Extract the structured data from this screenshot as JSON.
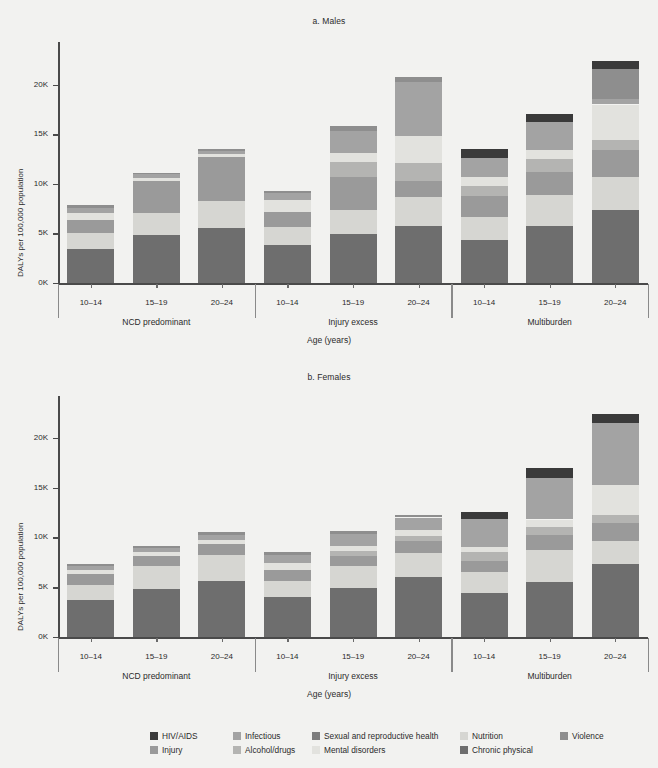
{
  "header": {
    "cropped_line": "Figure  ·  DALYs per 100 000 population by age group, sex and country group"
  },
  "panels": [
    {
      "title": "a. Males",
      "sex": "Males"
    },
    {
      "title": "b. Females",
      "sex": "Females"
    }
  ],
  "axis": {
    "ylabel": "DALYs per 100,000 population",
    "xlabel": "Age (years)",
    "yticks": [
      "0K",
      "5K",
      "10K",
      "15K",
      "20K"
    ],
    "ytick_values": [
      0,
      5000,
      10000,
      15000,
      20000
    ],
    "ymax": 24000
  },
  "groups": [
    "NCD predominant",
    "Injury excess",
    "Multiburden"
  ],
  "ages": [
    "10–14",
    "15–19",
    "20–24"
  ],
  "colors": {
    "HIV/AIDS": "#3a3a3a",
    "Infectious": "#a3a3a3",
    "Sexual and reproductive health": "#7d7d7d",
    "Nutrition": "#d6d6d2",
    "Violence": "#8e8e8e",
    "Injury": "#9a9a9a",
    "Alcohol/drugs": "#b4b4b2",
    "Mental disorders": "#e2e2de",
    "Chronic physical": "#6e6e6e"
  },
  "legend": [
    [
      {
        "label": "HIV/AIDS",
        "color": "#3a3a3a"
      },
      {
        "label": "Infectious",
        "color": "#a3a3a3"
      },
      {
        "label": "Sexual and reproductive health",
        "color": "#7d7d7d"
      },
      {
        "label": "Nutrition",
        "color": "#d6d6d2"
      },
      {
        "label": "Violence",
        "color": "#8e8e8e"
      }
    ],
    [
      {
        "label": "Injury",
        "color": "#9a9a9a"
      },
      {
        "label": "Alcohol/drugs",
        "color": "#b4b4b2"
      },
      {
        "label": "Mental disorders",
        "color": "#e2e2de"
      },
      {
        "label": "Chronic physical",
        "color": "#6e6e6e"
      }
    ]
  ],
  "chart_data": {
    "type": "bar",
    "subtype": "stacked-bar",
    "xlabel": "Age (years)",
    "ylabel": "DALYs per 100,000 population",
    "ylim": [
      0,
      24000
    ],
    "yticks": [
      0,
      5000,
      10000,
      15000,
      20000
    ],
    "ytick_labels": [
      "0K",
      "5K",
      "10K",
      "15K",
      "20K"
    ],
    "grid": false,
    "legend_position": "bottom",
    "categories": [
      "10–14",
      "15–19",
      "20–24"
    ],
    "groups": [
      "NCD predominant",
      "Injury excess",
      "Multiburden"
    ],
    "series_order": [
      "Chronic physical",
      "Mental disorders",
      "Injury",
      "Alcohol/drugs",
      "Infectious",
      "Sexual and reproductive health",
      "Nutrition",
      "Violence",
      "HIV/AIDS"
    ],
    "panels": [
      {
        "name": "a. Males",
        "bars": [
          {
            "group": "NCD predominant",
            "age": "10–14",
            "total": 7900,
            "segments": [
              {
                "name": "Chronic physical",
                "value": 3450
              },
              {
                "name": "Nutrition",
                "value": 1600
              },
              {
                "name": "Injury",
                "value": 1350
              },
              {
                "name": "Mental disorders",
                "value": 650
              },
              {
                "name": "Infectious",
                "value": 550
              },
              {
                "name": "Violence",
                "value": 300
              }
            ]
          },
          {
            "group": "NCD predominant",
            "age": "15–19",
            "total": 11100,
            "segments": [
              {
                "name": "Chronic physical",
                "value": 4800
              },
              {
                "name": "Nutrition",
                "value": 2250
              },
              {
                "name": "Injury",
                "value": 3200
              },
              {
                "name": "Mental disorders",
                "value": 350
              },
              {
                "name": "Infectious",
                "value": 350
              },
              {
                "name": "Violence",
                "value": 150
              }
            ]
          },
          {
            "group": "NCD predominant",
            "age": "20–24",
            "total": 13500,
            "segments": [
              {
                "name": "Chronic physical",
                "value": 5500
              },
              {
                "name": "Nutrition",
                "value": 2800
              },
              {
                "name": "Injury",
                "value": 4400
              },
              {
                "name": "Mental disorders",
                "value": 350
              },
              {
                "name": "Infectious",
                "value": 300
              },
              {
                "name": "Violence",
                "value": 150
              }
            ]
          },
          {
            "group": "Injury excess",
            "age": "10–14",
            "total": 9300,
            "segments": [
              {
                "name": "Chronic physical",
                "value": 3850
              },
              {
                "name": "Nutrition",
                "value": 1800
              },
              {
                "name": "Injury",
                "value": 1500
              },
              {
                "name": "Mental disorders",
                "value": 1250
              },
              {
                "name": "Infectious",
                "value": 650
              },
              {
                "name": "Violence",
                "value": 250
              }
            ]
          },
          {
            "group": "Injury excess",
            "age": "15–19",
            "total": 15800,
            "segments": [
              {
                "name": "Chronic physical",
                "value": 4900
              },
              {
                "name": "Nutrition",
                "value": 2500
              },
              {
                "name": "Injury",
                "value": 3300
              },
              {
                "name": "Alcohol/drugs",
                "value": 1500
              },
              {
                "name": "Mental disorders",
                "value": 900
              },
              {
                "name": "Infectious",
                "value": 2200
              },
              {
                "name": "Violence",
                "value": 500
              }
            ]
          },
          {
            "group": "Injury excess",
            "age": "20–24",
            "total": 20800,
            "segments": [
              {
                "name": "Chronic physical",
                "value": 5700
              },
              {
                "name": "Nutrition",
                "value": 3000
              },
              {
                "name": "Injury",
                "value": 1600
              },
              {
                "name": "Alcohol/drugs",
                "value": 1800
              },
              {
                "name": "Mental disorders",
                "value": 2700
              },
              {
                "name": "Infectious",
                "value": 5500
              },
              {
                "name": "Violence",
                "value": 500
              }
            ]
          },
          {
            "group": "Multiburden",
            "age": "10–14",
            "total": 13500,
            "segments": [
              {
                "name": "Chronic physical",
                "value": 4300
              },
              {
                "name": "Nutrition",
                "value": 2400
              },
              {
                "name": "Injury",
                "value": 2100
              },
              {
                "name": "Alcohol/drugs",
                "value": 1000
              },
              {
                "name": "Mental disorders",
                "value": 900
              },
              {
                "name": "Infectious",
                "value": 1900
              },
              {
                "name": "HIV/AIDS",
                "value": 900
              }
            ]
          },
          {
            "group": "Multiburden",
            "age": "15–19",
            "total": 17000,
            "segments": [
              {
                "name": "Chronic physical",
                "value": 5700
              },
              {
                "name": "Nutrition",
                "value": 3200
              },
              {
                "name": "Injury",
                "value": 2300
              },
              {
                "name": "Alcohol/drugs",
                "value": 1300
              },
              {
                "name": "Mental disorders",
                "value": 900
              },
              {
                "name": "Infectious",
                "value": 2800
              },
              {
                "name": "HIV/AIDS",
                "value": 800
              }
            ]
          },
          {
            "group": "Multiburden",
            "age": "20–24",
            "total": 22400,
            "segments": [
              {
                "name": "Chronic physical",
                "value": 7400
              },
              {
                "name": "Nutrition",
                "value": 3300
              },
              {
                "name": "Injury",
                "value": 2700
              },
              {
                "name": "Alcohol/drugs",
                "value": 1000
              },
              {
                "name": "Mental disorders",
                "value": 3600
              },
              {
                "name": "Infectious",
                "value": 600
              },
              {
                "name": "Violence",
                "value": 3000
              },
              {
                "name": "HIV/AIDS",
                "value": 800
              }
            ]
          }
        ]
      },
      {
        "name": "b. Females",
        "bars": [
          {
            "group": "NCD predominant",
            "age": "10–14",
            "total": 7300,
            "segments": [
              {
                "name": "Chronic physical",
                "value": 3700
              },
              {
                "name": "Nutrition",
                "value": 1500
              },
              {
                "name": "Injury",
                "value": 1100
              },
              {
                "name": "Mental disorders",
                "value": 400
              },
              {
                "name": "Infectious",
                "value": 400
              },
              {
                "name": "Violence",
                "value": 200
              }
            ]
          },
          {
            "group": "NCD predominant",
            "age": "15–19",
            "total": 9100,
            "segments": [
              {
                "name": "Chronic physical",
                "value": 4850
              },
              {
                "name": "Nutrition",
                "value": 2300
              },
              {
                "name": "Injury",
                "value": 1000
              },
              {
                "name": "Mental disorders",
                "value": 350
              },
              {
                "name": "Infectious",
                "value": 400
              },
              {
                "name": "Violence",
                "value": 200
              }
            ]
          },
          {
            "group": "NCD predominant",
            "age": "20–24",
            "total": 10500,
            "segments": [
              {
                "name": "Chronic physical",
                "value": 5600
              },
              {
                "name": "Nutrition",
                "value": 2600
              },
              {
                "name": "Injury",
                "value": 1100
              },
              {
                "name": "Mental disorders",
                "value": 400
              },
              {
                "name": "Infectious",
                "value": 500
              },
              {
                "name": "Violence",
                "value": 300
              }
            ]
          },
          {
            "group": "Injury excess",
            "age": "10–14",
            "total": 8500,
            "segments": [
              {
                "name": "Chronic physical",
                "value": 4000
              },
              {
                "name": "Nutrition",
                "value": 1600
              },
              {
                "name": "Injury",
                "value": 1100
              },
              {
                "name": "Mental disorders",
                "value": 700
              },
              {
                "name": "Infectious",
                "value": 850
              },
              {
                "name": "Violence",
                "value": 250
              }
            ]
          },
          {
            "group": "Injury excess",
            "age": "15–19",
            "total": 10600,
            "segments": [
              {
                "name": "Chronic physical",
                "value": 4950
              },
              {
                "name": "Nutrition",
                "value": 2200
              },
              {
                "name": "Injury",
                "value": 1000
              },
              {
                "name": "Alcohol/drugs",
                "value": 500
              },
              {
                "name": "Mental disorders",
                "value": 500
              },
              {
                "name": "Infectious",
                "value": 1200
              },
              {
                "name": "Violence",
                "value": 250
              }
            ]
          },
          {
            "group": "Injury excess",
            "age": "20–24",
            "total": 12300,
            "segments": [
              {
                "name": "Chronic physical",
                "value": 6000
              },
              {
                "name": "Nutrition",
                "value": 2400
              },
              {
                "name": "Injury",
                "value": 1200
              },
              {
                "name": "Alcohol/drugs",
                "value": 500
              },
              {
                "name": "Mental disorders",
                "value": 600
              },
              {
                "name": "Infectious",
                "value": 1300
              },
              {
                "name": "Violence",
                "value": 300
              }
            ]
          },
          {
            "group": "Multiburden",
            "age": "10–14",
            "total": 12600,
            "segments": [
              {
                "name": "Chronic physical",
                "value": 4400
              },
              {
                "name": "Nutrition",
                "value": 2100
              },
              {
                "name": "Injury",
                "value": 1100
              },
              {
                "name": "Alcohol/drugs",
                "value": 900
              },
              {
                "name": "Mental disorders",
                "value": 500
              },
              {
                "name": "Infectious",
                "value": 2800
              },
              {
                "name": "HIV/AIDS",
                "value": 800
              }
            ]
          },
          {
            "group": "Multiburden",
            "age": "15–19",
            "total": 17000,
            "segments": [
              {
                "name": "Chronic physical",
                "value": 5500
              },
              {
                "name": "Nutrition",
                "value": 3200
              },
              {
                "name": "Injury",
                "value": 1500
              },
              {
                "name": "Alcohol/drugs",
                "value": 800
              },
              {
                "name": "Mental disorders",
                "value": 800
              },
              {
                "name": "Infectious",
                "value": 4200
              },
              {
                "name": "HIV/AIDS",
                "value": 1000
              }
            ]
          },
          {
            "group": "Multiburden",
            "age": "20–24",
            "total": 22400,
            "segments": [
              {
                "name": "Chronic physical",
                "value": 7300
              },
              {
                "name": "Nutrition",
                "value": 2300
              },
              {
                "name": "Injury",
                "value": 1800
              },
              {
                "name": "Alcohol/drugs",
                "value": 900
              },
              {
                "name": "Mental disorders",
                "value": 3000
              },
              {
                "name": "Infectious",
                "value": 6200
              },
              {
                "name": "HIV/AIDS",
                "value": 900
              }
            ]
          }
        ]
      }
    ]
  }
}
